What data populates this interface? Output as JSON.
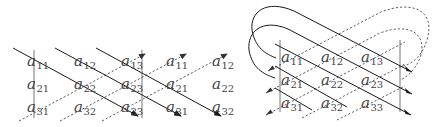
{
  "figure": {
    "width": 439,
    "height": 127,
    "colors": {
      "background": "#ffffff",
      "solid_line": "#1a1a1a",
      "dashed_line": "#333333",
      "bar": "#666666",
      "text": "#444444"
    }
  },
  "left_diagram": {
    "name": "Rule of Sarrus (augmented matrix)",
    "columns_x": [
      35,
      82,
      129,
      174,
      220
    ],
    "rows_y": [
      66,
      89,
      112
    ],
    "entries": [
      [
        {
          "base": "a",
          "sub": "11"
        },
        {
          "base": "a",
          "sub": "12"
        },
        {
          "base": "a",
          "sub": "13"
        },
        {
          "base": "a",
          "sub": "11"
        },
        {
          "base": "a",
          "sub": "12"
        }
      ],
      [
        {
          "base": "a",
          "sub": "21"
        },
        {
          "base": "a",
          "sub": "22"
        },
        {
          "base": "a",
          "sub": "23"
        },
        {
          "base": "a",
          "sub": "21"
        },
        {
          "base": "a",
          "sub": "22"
        }
      ],
      [
        {
          "base": "a",
          "sub": "31"
        },
        {
          "base": "a",
          "sub": "32"
        },
        {
          "base": "a",
          "sub": "33"
        },
        {
          "base": "a",
          "sub": "31"
        },
        {
          "base": "a",
          "sub": "32"
        }
      ]
    ],
    "bars": [
      {
        "x": 34,
        "y1": 50,
        "y2": 118
      },
      {
        "x": 142,
        "y1": 50,
        "y2": 118
      }
    ],
    "solid_diagonals": [
      {
        "x1": 13,
        "y1": 48,
        "x2": 138,
        "y2": 116
      },
      {
        "x1": 55,
        "y1": 48,
        "x2": 181,
        "y2": 116
      },
      {
        "x1": 96,
        "y1": 48,
        "x2": 221,
        "y2": 116
      }
    ],
    "dashed_diagonals": [
      {
        "x1": 19,
        "y1": 121,
        "x2": 145,
        "y2": 54
      },
      {
        "x1": 60,
        "y1": 121,
        "x2": 186,
        "y2": 54
      },
      {
        "x1": 102,
        "y1": 121,
        "x2": 227,
        "y2": 54
      }
    ]
  },
  "right_diagram": {
    "name": "Cyclic diagonals (wrapped matrix)",
    "columns_x": [
      289,
      329,
      369
    ],
    "rows_y": [
      62,
      85,
      108
    ],
    "entries": [
      [
        {
          "base": "a",
          "sub": "11"
        },
        {
          "base": "a",
          "sub": "12"
        },
        {
          "base": "a",
          "sub": "13"
        }
      ],
      [
        {
          "base": "a",
          "sub": "21"
        },
        {
          "base": "a",
          "sub": "22"
        },
        {
          "base": "a",
          "sub": "23"
        }
      ],
      [
        {
          "base": "a",
          "sub": "31"
        },
        {
          "base": "a",
          "sub": "32"
        },
        {
          "base": "a",
          "sub": "33"
        }
      ]
    ],
    "bars": [
      {
        "x": 280,
        "y1": 40,
        "y2": 112
      },
      {
        "x": 400,
        "y1": 40,
        "y2": 112
      }
    ],
    "solid_paths": [
      "M 412 72 L 294 11 C 266 -1 250 12 252 30 C 255 48 266 54 276 58",
      "M 412 94 L 288 29 C 262 18 247 32 249 50 C 252 68 263 74 275 78",
      "M 275 44 L 411 115",
      "M 275 66 L 347 107",
      "M 275 88 L 312 110"
    ],
    "solid_arrowheads": [
      {
        "x": 412,
        "y": 72
      },
      {
        "x": 412,
        "y": 94
      },
      {
        "x": 411,
        "y": 115
      }
    ],
    "dashed_paths": [
      "M 268 71 L 381 12 C 412 0 436 10 427 40 C 421 58 412 64 400 67",
      "M 266 93 L 380 33 C 410 22 428 34 420 58 C 414 72 405 78 400 80",
      "M 266 115 L 405 42",
      "M 302 118 L 405 64",
      "M 337 120 L 405 86"
    ],
    "dashed_arrowheads": [
      {
        "x": 268,
        "y": 71
      },
      {
        "x": 266,
        "y": 93
      },
      {
        "x": 266,
        "y": 115
      }
    ]
  }
}
